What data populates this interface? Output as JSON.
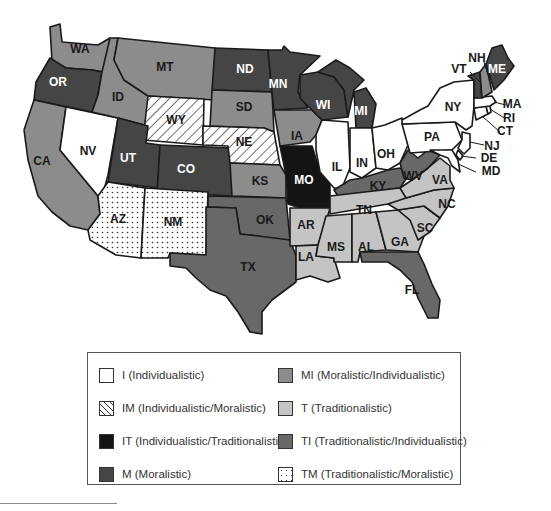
{
  "colors": {
    "I": "#ffffff",
    "IM": "hatch",
    "IT": "#141414",
    "M": "#454545",
    "MI": "#8c8c8c",
    "T": "#c4c4c4",
    "TI": "#686868",
    "TM": "dots"
  },
  "states": [
    {
      "abbr": "WA",
      "culture": "MI"
    },
    {
      "abbr": "OR",
      "culture": "M"
    },
    {
      "abbr": "CA",
      "culture": "MI"
    },
    {
      "abbr": "NV",
      "culture": "I"
    },
    {
      "abbr": "ID",
      "culture": "MI"
    },
    {
      "abbr": "MT",
      "culture": "MI"
    },
    {
      "abbr": "WY",
      "culture": "IM"
    },
    {
      "abbr": "UT",
      "culture": "M"
    },
    {
      "abbr": "CO",
      "culture": "M"
    },
    {
      "abbr": "AZ",
      "culture": "TM"
    },
    {
      "abbr": "NM",
      "culture": "TM"
    },
    {
      "abbr": "ND",
      "culture": "M"
    },
    {
      "abbr": "SD",
      "culture": "MI"
    },
    {
      "abbr": "NE",
      "culture": "IM"
    },
    {
      "abbr": "KS",
      "culture": "MI"
    },
    {
      "abbr": "OK",
      "culture": "TI"
    },
    {
      "abbr": "TX",
      "culture": "TI"
    },
    {
      "abbr": "MN",
      "culture": "M"
    },
    {
      "abbr": "IA",
      "culture": "MI"
    },
    {
      "abbr": "MO",
      "culture": "IT"
    },
    {
      "abbr": "AR",
      "culture": "T"
    },
    {
      "abbr": "LA",
      "culture": "T"
    },
    {
      "abbr": "WI",
      "culture": "M"
    },
    {
      "abbr": "IL",
      "culture": "I"
    },
    {
      "abbr": "MI",
      "culture": "M"
    },
    {
      "abbr": "IN",
      "culture": "I"
    },
    {
      "abbr": "OH",
      "culture": "I"
    },
    {
      "abbr": "KY",
      "culture": "TI"
    },
    {
      "abbr": "TN",
      "culture": "T"
    },
    {
      "abbr": "MS",
      "culture": "T"
    },
    {
      "abbr": "AL",
      "culture": "T"
    },
    {
      "abbr": "GA",
      "culture": "T"
    },
    {
      "abbr": "FL",
      "culture": "TI"
    },
    {
      "abbr": "SC",
      "culture": "T"
    },
    {
      "abbr": "NC",
      "culture": "T"
    },
    {
      "abbr": "VA",
      "culture": "T"
    },
    {
      "abbr": "WV",
      "culture": "TI"
    },
    {
      "abbr": "PA",
      "culture": "I"
    },
    {
      "abbr": "NY",
      "culture": "I"
    },
    {
      "abbr": "NJ",
      "culture": "I"
    },
    {
      "abbr": "DE",
      "culture": "I"
    },
    {
      "abbr": "MD",
      "culture": "I"
    },
    {
      "abbr": "CT",
      "culture": "I"
    },
    {
      "abbr": "RI",
      "culture": "I"
    },
    {
      "abbr": "MA",
      "culture": "I"
    },
    {
      "abbr": "VT",
      "culture": "M"
    },
    {
      "abbr": "NH",
      "culture": "MI"
    },
    {
      "abbr": "ME",
      "culture": "M"
    }
  ],
  "labels": {
    "WA": "WA",
    "OR": "OR",
    "CA": "CA",
    "NV": "NV",
    "ID": "ID",
    "MT": "MT",
    "WY": "WY",
    "UT": "UT",
    "CO": "CO",
    "AZ": "AZ",
    "NM": "NM",
    "ND": "ND",
    "SD": "SD",
    "NE": "NE",
    "KS": "KS",
    "OK": "OK",
    "TX": "TX",
    "MN": "MN",
    "IA": "IA",
    "MO": "MO",
    "AR": "AR",
    "LA": "LA",
    "WI": "WI",
    "IL": "IL",
    "MI": "MI",
    "IN": "IN",
    "OH": "OH",
    "KY": "KY",
    "TN": "TN",
    "MS": "MS",
    "AL": "AL",
    "GA": "GA",
    "FL": "FL",
    "SC": "SC",
    "NC": "NC",
    "VA": "VA",
    "WV": "WV",
    "PA": "PA",
    "NY": "NY",
    "NJ": "NJ",
    "DE": "DE",
    "MD": "MD",
    "CT": "CT",
    "RI": "RI",
    "MA": "MA",
    "VT": "VT",
    "NH": "NH",
    "ME": "ME"
  },
  "legend": {
    "items": [
      {
        "code": "I",
        "label": "I (Individualistic)"
      },
      {
        "code": "IM",
        "label": "IM (Individualistic/Moralistic)"
      },
      {
        "code": "IT",
        "label": "IT (Individualistic/Traditionalistic)"
      },
      {
        "code": "M",
        "label": "M (Moralistic)"
      },
      {
        "code": "MI",
        "label": "MI (Moralistic/Individualistic)"
      },
      {
        "code": "T",
        "label": "T (Traditionalistic)"
      },
      {
        "code": "TI",
        "label": "TI (Traditionalistic/Individualistic)"
      },
      {
        "code": "TM",
        "label": "TM (Traditionalistic/Moralistic)"
      }
    ]
  }
}
